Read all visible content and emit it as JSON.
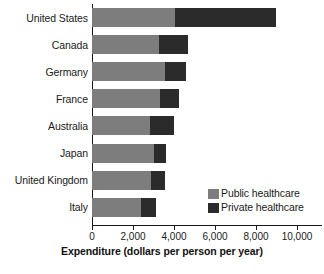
{
  "chart_data": {
    "type": "bar",
    "orientation": "horizontal",
    "stacked": true,
    "title": "",
    "xlabel": "Expenditure (dollars per person per year)",
    "ylabel": "",
    "xlim": [
      0,
      10500
    ],
    "xticks": [
      0,
      2000,
      4000,
      6000,
      8000,
      10000
    ],
    "xticklabels": [
      "0",
      "2,000",
      "4,000",
      "6,000",
      "8,000",
      "10,000"
    ],
    "grid": false,
    "legend_position": "inside-lower-right",
    "categories": [
      "United States",
      "Canada",
      "Germany",
      "France",
      "Australia",
      "Japan",
      "United Kingdom",
      "Italy"
    ],
    "series": [
      {
        "name": "Public healthcare",
        "color": "#7d7d7d",
        "values": [
          4030,
          3250,
          3540,
          3300,
          2810,
          3010,
          2860,
          2380
        ]
      },
      {
        "name": "Private healthcare",
        "color": "#2b2b2b",
        "values": [
          4950,
          1450,
          1060,
          930,
          1190,
          620,
          680,
          740
        ]
      }
    ],
    "totals": [
      8980,
      4700,
      4600,
      4230,
      4000,
      3630,
      3540,
      3120
    ]
  },
  "legend": {
    "items": [
      {
        "label": "Public healthcare",
        "color": "#7d7d7d"
      },
      {
        "label": "Private healthcare",
        "color": "#2b2b2b"
      }
    ]
  },
  "axis": {
    "x_title": "Expenditure (dollars per person per year)"
  },
  "caption": {
    "partial_text": ""
  }
}
